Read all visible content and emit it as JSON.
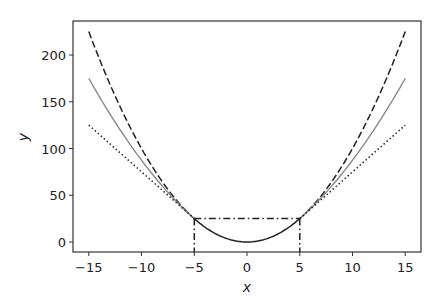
{
  "chart_data": {
    "type": "line",
    "title": "",
    "xlabel": "x",
    "ylabel": "y",
    "xlim": [
      -16.5,
      16.5
    ],
    "ylim": [
      -11,
      236
    ],
    "xticks": [
      -15,
      -10,
      -5,
      0,
      5,
      10,
      15
    ],
    "xtick_labels": [
      "−15",
      "−10",
      "−5",
      "0",
      "5",
      "10",
      "15"
    ],
    "yticks": [
      0,
      50,
      100,
      150,
      200
    ],
    "ytick_labels": [
      "0",
      "50",
      "100",
      "150",
      "200"
    ],
    "grid": false,
    "legend": null,
    "series": [
      {
        "name": "quadratic (x^2)",
        "style": "dashed",
        "color": "#222222",
        "x": [
          -15,
          -12.5,
          -10,
          -7.5,
          -5,
          5,
          7.5,
          10,
          12.5,
          15
        ],
        "y": [
          225,
          156.25,
          100,
          56.25,
          25,
          25,
          56.25,
          100,
          156.25,
          225
        ]
      },
      {
        "name": "average of quadratic and tangent",
        "style": "solid",
        "color": "#888888",
        "x": [
          -15,
          -12.5,
          -10,
          -7.5,
          -5,
          5,
          7.5,
          10,
          12.5,
          15
        ],
        "y": [
          175,
          122.5,
          75,
          43.75,
          25,
          25,
          43.75,
          75,
          122.5,
          175
        ]
      },
      {
        "name": "tangent line",
        "style": "dotted",
        "color": "#222222",
        "x": [
          -15,
          -5,
          5,
          15
        ],
        "y": [
          125,
          25,
          25,
          125
        ]
      },
      {
        "name": "central parabola",
        "style": "solid",
        "color": "#222222",
        "x": [
          -5,
          -4,
          -3,
          -2,
          -1,
          0,
          1,
          2,
          3,
          4,
          5
        ],
        "y": [
          25,
          16,
          9,
          4,
          1,
          0,
          1,
          4,
          9,
          16,
          25
        ]
      },
      {
        "name": "threshold markers",
        "style": "dashdot",
        "color": "#222222",
        "segments": [
          {
            "x": [
              -5,
              5
            ],
            "y": [
              25,
              25
            ]
          },
          {
            "x": [
              -5,
              -5
            ],
            "y": [
              25,
              -11
            ]
          },
          {
            "x": [
              5,
              5
            ],
            "y": [
              25,
              -11
            ]
          }
        ]
      }
    ]
  }
}
